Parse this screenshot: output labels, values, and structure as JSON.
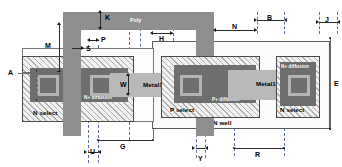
{
  "diagram": {
    "layers": [
      {
        "key": "poly",
        "name": "Poly",
        "color": "#8e8e8e"
      },
      {
        "key": "metal1",
        "name": "Metal1",
        "color": "#b9b9b9"
      },
      {
        "key": "ndiff",
        "name": "N+ diffusion",
        "color": "#6e6e6e"
      },
      {
        "key": "pdiff",
        "name": "P+ diffusion",
        "color": "#6e6e6e"
      },
      {
        "key": "nselect",
        "name": "N select",
        "color": "#f2f2f2"
      },
      {
        "key": "pselect",
        "name": "P select",
        "color": "#f2f2f2"
      },
      {
        "key": "nwell",
        "name": "N well",
        "color": "#fbfbfb"
      }
    ],
    "layer_labels": {
      "poly": "Poly",
      "metal1_left": "Metal1",
      "metal1_right": "Metal1",
      "ndiff_left": "N+ diffusion",
      "ndiff_right": "N+ diffusion",
      "pdiff": "P+ diffusion",
      "nselect_left": "N select",
      "nselect_right": "N select",
      "pselect": "P select",
      "nwell": "N well"
    },
    "dimensions": [
      {
        "id": "A",
        "label": "A",
        "orientation": "vertical",
        "kind": "leader"
      },
      {
        "id": "M",
        "label": "M",
        "orientation": "vertical",
        "kind": "double-arrow"
      },
      {
        "id": "K",
        "label": "K",
        "orientation": "vertical",
        "kind": "double-arrow"
      },
      {
        "id": "S",
        "label": "S",
        "orientation": "horizontal",
        "kind": "single-arrow"
      },
      {
        "id": "P",
        "label": "P",
        "orientation": "horizontal",
        "kind": "double-arrow"
      },
      {
        "id": "H",
        "label": "H",
        "orientation": "horizontal",
        "kind": "double-arrow"
      },
      {
        "id": "B",
        "label": "B",
        "orientation": "horizontal",
        "kind": "double-arrow"
      },
      {
        "id": "N",
        "label": "N",
        "orientation": "horizontal",
        "kind": "double-arrow"
      },
      {
        "id": "J",
        "label": "J",
        "orientation": "horizontal",
        "kind": "double-arrow"
      },
      {
        "id": "E",
        "label": "E",
        "orientation": "vertical",
        "kind": "double-arrow"
      },
      {
        "id": "W",
        "label": "W",
        "orientation": "vertical",
        "kind": "double-arrow"
      },
      {
        "id": "G",
        "label": "G",
        "orientation": "horizontal",
        "kind": "double-arrow"
      },
      {
        "id": "U",
        "label": "U",
        "orientation": "horizontal",
        "kind": "double-arrow"
      },
      {
        "id": "Y",
        "label": "Y",
        "orientation": "horizontal",
        "kind": "double-arrow"
      },
      {
        "id": "R",
        "label": "R",
        "orientation": "horizontal",
        "kind": "double-arrow"
      }
    ],
    "colors": {
      "poly": "#8e8e8e",
      "metal": "#b9b9b9",
      "contact": "#6f6f6f",
      "diffusion": "#6e6e6e",
      "guide": "#5b6fa8",
      "arrow": "#1a1a1a",
      "background": "#ffffff"
    }
  }
}
